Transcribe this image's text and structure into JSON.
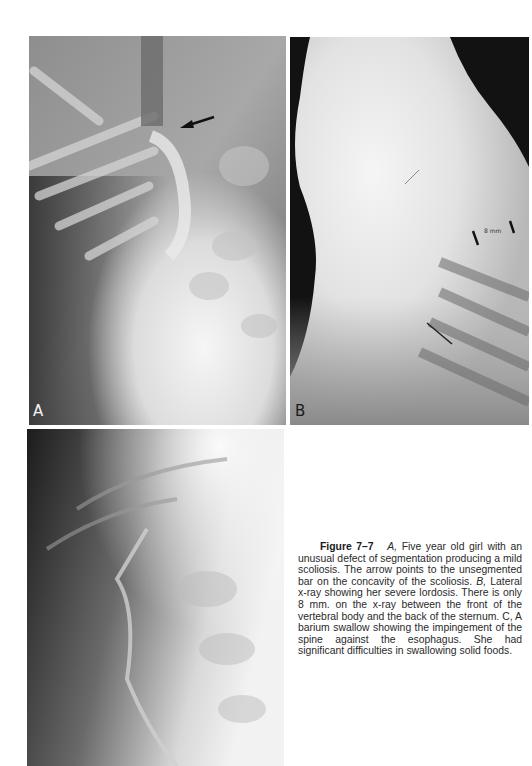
{
  "figure": {
    "number_label": "Figure 7–7",
    "panels": [
      {
        "id": "A",
        "label": "A",
        "description": "AP x-ray of spine with arrow pointing to unsegmented bar"
      },
      {
        "id": "B",
        "label": "B",
        "description": "Lateral x-ray showing severe lordosis",
        "measurement_annotation": "8 mm"
      },
      {
        "id": "C",
        "label": "",
        "description": "Barium swallow x-ray"
      }
    ],
    "caption": {
      "part_a_label": "A,",
      "part_a_text": " Five year old girl with an unusual defect of segmentation producing a mild scoliosis. The arrow points to the unsegmented bar on the concavity of the scoliosis. ",
      "part_b_label": "B,",
      "part_b_text": " Lateral x-ray showing her severe lordosis. There is only 8 mm. on the x-ray between the front of the vertebral body and the back of the sternum. ",
      "part_c_label": "C,",
      "part_c_text": " A barium swallow showing the impingement of the spine against the esophagus. She had significant difficulties in swallowing solid foods."
    }
  }
}
